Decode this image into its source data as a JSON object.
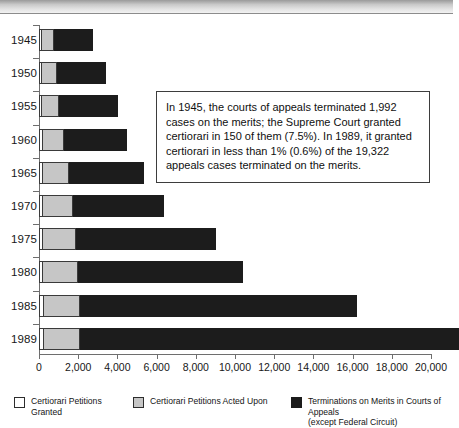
{
  "chart_data": {
    "type": "bar",
    "orientation": "horizontal",
    "stacked": true,
    "title": "",
    "xlabel": "",
    "ylabel": "",
    "xlim": [
      0,
      20000
    ],
    "xticks": [
      0,
      2000,
      4000,
      6000,
      8000,
      10000,
      12000,
      14000,
      16000,
      18000,
      20000
    ],
    "xticklabels": [
      "0",
      "2,000",
      "4,000",
      "6,000",
      "8,000",
      "10,000",
      "12,000",
      "14,000",
      "16,000",
      "18,000",
      "20,000"
    ],
    "grid": false,
    "legend_position": "bottom",
    "categories": [
      "1945",
      "1950",
      "1955",
      "1960",
      "1965",
      "1970",
      "1975",
      "1980",
      "1985",
      "1989"
    ],
    "series": [
      {
        "name": "Certiorari Petitions Granted",
        "color": "#ffffff",
        "values": [
          150,
          160,
          170,
          180,
          190,
          200,
          210,
          220,
          230,
          240
        ]
      },
      {
        "name": "Certiorari Petitions Acted Upon",
        "color": "#c6c6c6",
        "values": [
          620,
          760,
          860,
          1080,
          1340,
          1560,
          1700,
          1780,
          1840,
          1860
        ]
      },
      {
        "name": "Terminations on Merits in Courts of Appeals (except Federal Circuit)",
        "color": "#1c1c1c",
        "values": [
          1992,
          2480,
          3020,
          3240,
          3820,
          4640,
          7140,
          8400,
          14130,
          19322
        ]
      }
    ],
    "annotation": "In 1945, the courts of appeals terminated 1,992 cases on the merits; the Supreme Court granted certiorari in 150 of them (7.5%).  In 1989, it granted certiorari in less than 1% (0.6%) of the 19,322 appeals cases terminated on the merits."
  },
  "axis": {
    "years": [
      "1945",
      "1950",
      "1955",
      "1960",
      "1965",
      "1970",
      "1975",
      "1980",
      "1985",
      "1989"
    ],
    "x_labels": [
      "0",
      "2,000",
      "4,000",
      "6,000",
      "8,000",
      "10,000",
      "12,000",
      "14,000",
      "16,000",
      "18,000",
      "20,000"
    ]
  },
  "annotation": {
    "text": "In 1945, the courts of appeals terminated 1,992 cases on the merits; the Supreme Court granted certiorari in 150 of them (7.5%).  In 1989, it granted certiorari in less than 1% (0.6%) of the 19,322 appeals cases terminated on the merits."
  },
  "legend": {
    "items": [
      {
        "label": "Certiorari Petitions Granted",
        "color": "#ffffff"
      },
      {
        "label": "Certiorari Petitions Acted Upon",
        "color": "#c6c6c6"
      },
      {
        "label": "Terminations on Merits in Courts of Appeals\n(except Federal Circuit)",
        "color": "#1c1c1c"
      }
    ]
  }
}
